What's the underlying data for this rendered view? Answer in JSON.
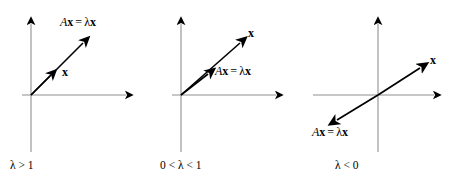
{
  "figure": {
    "axis_color": "#909090",
    "vector_color": "#000000",
    "background_color": "#ffffff",
    "panels": [
      {
        "id": "panel-1",
        "condition": "λ > 1",
        "vector_label": "x",
        "transformed_label_matrix": "A",
        "transformed_label_vector": "x",
        "transformed_label_equals": "=",
        "transformed_label_lambda": "λ",
        "transformed_label_lambda_vector": "x",
        "origin": {
          "x": 31,
          "y": 95
        },
        "x_axis": {
          "from_x": 22,
          "to_x": 132,
          "y": 95
        },
        "y_axis": {
          "x": 31,
          "from_y": 152,
          "to_y": 17
        },
        "arrows": [
          {
            "name": "x-vector",
            "x1": 31,
            "y1": 95,
            "x2": 54,
            "y2": 72,
            "length": "short"
          },
          {
            "name": "ax-vector",
            "x1": 31,
            "y1": 95,
            "x2": 88,
            "y2": 38,
            "length": "long"
          }
        ]
      },
      {
        "id": "panel-2",
        "condition": "0 < λ < 1",
        "vector_label": "x",
        "transformed_label_matrix": "A",
        "transformed_label_vector": "x",
        "transformed_label_equals": "=",
        "transformed_label_lambda": "λ",
        "transformed_label_lambda_vector": "x",
        "origin": {
          "x": 31,
          "y": 95
        },
        "x_axis": {
          "from_x": 22,
          "to_x": 132,
          "y": 95
        },
        "y_axis": {
          "x": 31,
          "from_y": 152,
          "to_y": 17
        },
        "arrows": [
          {
            "name": "ax-vector",
            "x1": 31,
            "y1": 95,
            "x2": 62,
            "y2": 70,
            "length": "short"
          },
          {
            "name": "x-vector",
            "x1": 31,
            "y1": 95,
            "x2": 95,
            "y2": 38,
            "length": "long"
          }
        ]
      },
      {
        "id": "panel-3",
        "condition": "λ < 0",
        "vector_label": "x",
        "transformed_label_matrix": "A",
        "transformed_label_vector": "x",
        "transformed_label_equals": "=",
        "transformed_label_lambda": "λ",
        "transformed_label_lambda_vector": "x",
        "origin": {
          "x": 78,
          "y": 95
        },
        "x_axis": {
          "from_x": 13,
          "to_x": 140,
          "y": 95
        },
        "y_axis": {
          "x": 78,
          "from_y": 152,
          "to_y": 17
        },
        "arrows": [
          {
            "name": "x-vector",
            "x1": 78,
            "y1": 95,
            "x2": 125,
            "y2": 64,
            "length": "long"
          },
          {
            "name": "ax-vector",
            "x1": 78,
            "y1": 95,
            "x2": 32,
            "y2": 123,
            "length": "short"
          }
        ]
      }
    ]
  }
}
